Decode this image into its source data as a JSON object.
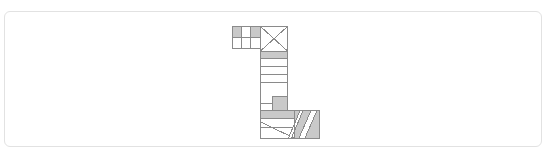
{
  "card": {
    "background": "#ffffff",
    "border_color": "#e2e2e2",
    "corner_radius": 6,
    "x": 4,
    "y": 11,
    "width": 538,
    "height": 136
  },
  "figure": {
    "name": "l-shaped-block-diagram",
    "stroke_color": "#8a8a8a",
    "fill_gray": "#c9c9c9",
    "fill_white": "#ffffff",
    "stroke_width": 1,
    "bounds": {
      "x": 232,
      "y": 26,
      "width": 88,
      "height": 112
    },
    "shapes": [
      {
        "id": "top-cell-1",
        "type": "rect",
        "x": 232,
        "y": 26,
        "w": 9,
        "h": 11,
        "fill": "gray"
      },
      {
        "id": "top-cell-2",
        "type": "rect",
        "x": 241,
        "y": 26,
        "w": 9,
        "h": 11,
        "fill": "white"
      },
      {
        "id": "top-cell-3",
        "type": "rect",
        "x": 250,
        "y": 26,
        "w": 10,
        "h": 11,
        "fill": "gray"
      },
      {
        "id": "top-cell-4",
        "type": "rect",
        "x": 232,
        "y": 37,
        "w": 9,
        "h": 11,
        "fill": "white"
      },
      {
        "id": "top-cell-5",
        "type": "rect",
        "x": 241,
        "y": 37,
        "w": 9,
        "h": 11,
        "fill": "white"
      },
      {
        "id": "top-cell-6",
        "type": "rect",
        "x": 250,
        "y": 37,
        "w": 10,
        "h": 11,
        "fill": "white"
      },
      {
        "id": "x-square",
        "type": "rect-crossed",
        "x": 260,
        "y": 26,
        "w": 28,
        "h": 25,
        "fill": "white"
      },
      {
        "id": "band-head",
        "type": "rect",
        "x": 260,
        "y": 51,
        "w": 28,
        "h": 7,
        "fill": "gray"
      },
      {
        "id": "band-1",
        "type": "rect",
        "x": 260,
        "y": 58,
        "w": 28,
        "h": 8,
        "fill": "white"
      },
      {
        "id": "band-2",
        "type": "rect",
        "x": 260,
        "y": 66,
        "w": 28,
        "h": 8,
        "fill": "white"
      },
      {
        "id": "band-3",
        "type": "rect",
        "x": 260,
        "y": 74,
        "w": 28,
        "h": 8,
        "fill": "white"
      },
      {
        "id": "column-body",
        "type": "rect",
        "x": 260,
        "y": 82,
        "w": 28,
        "h": 21,
        "fill": "white"
      },
      {
        "id": "raised-box",
        "type": "rect",
        "x": 272,
        "y": 96,
        "w": 16,
        "h": 14,
        "fill": "gray"
      },
      {
        "id": "base-upper-left",
        "type": "rect",
        "x": 260,
        "y": 110,
        "w": 12,
        "h": 8,
        "fill": "gray"
      },
      {
        "id": "base-band",
        "type": "rect",
        "x": 260,
        "y": 110,
        "w": 34,
        "h": 8,
        "fill": "gray"
      },
      {
        "id": "base-mid",
        "type": "rect",
        "x": 260,
        "y": 118,
        "w": 34,
        "h": 9,
        "fill": "white"
      },
      {
        "id": "base-lower",
        "type": "rect",
        "x": 260,
        "y": 127,
        "w": 34,
        "h": 11,
        "fill": "white"
      },
      {
        "id": "base-diag",
        "type": "diagonal",
        "x1": 260,
        "y1": 122,
        "x2": 294,
        "y2": 138
      },
      {
        "id": "wedge-right",
        "type": "polygon",
        "points": "294,110 320,110 320,138 294,138",
        "fill": "gray"
      },
      {
        "id": "stripe-a",
        "type": "polygon",
        "points": "299,138 311,110 317,110 305,138",
        "fill": "white"
      },
      {
        "id": "stripe-b",
        "type": "polygon",
        "points": "288,138 300,110 303,110 291,138",
        "fill": "white"
      }
    ]
  }
}
